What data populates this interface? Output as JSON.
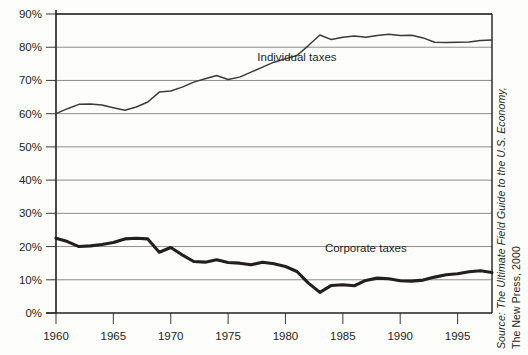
{
  "chart_data": {
    "type": "line",
    "title": "",
    "subtitle": "",
    "xlabel": "",
    "ylabel": "",
    "xlim": [
      1960,
      1998
    ],
    "ylim": [
      0,
      90
    ],
    "grid": true,
    "grid_axis": "y",
    "legend": "inline-annotations",
    "y_tick_labels": [
      "0%",
      "10%",
      "20%",
      "30%",
      "40%",
      "50%",
      "60%",
      "70%",
      "80%",
      "90%"
    ],
    "y_ticks": [
      0,
      10,
      20,
      30,
      40,
      50,
      60,
      70,
      80,
      90
    ],
    "x_tick_labels": [
      "1960",
      "1965",
      "1970",
      "1975",
      "1980",
      "1985",
      "1990",
      "1995"
    ],
    "x_ticks": [
      1960,
      1965,
      1970,
      1975,
      1980,
      1985,
      1990,
      1995
    ],
    "x": [
      1960,
      1961,
      1962,
      1963,
      1964,
      1965,
      1966,
      1967,
      1968,
      1969,
      1970,
      1971,
      1972,
      1973,
      1974,
      1975,
      1976,
      1977,
      1978,
      1979,
      1980,
      1981,
      1982,
      1983,
      1984,
      1985,
      1986,
      1987,
      1988,
      1989,
      1990,
      1991,
      1992,
      1993,
      1994,
      1995,
      1996,
      1997,
      1998
    ],
    "series": [
      {
        "name": "Individual taxes",
        "annotation": "Individual taxes",
        "values": [
          60.0,
          61.5,
          62.8,
          62.9,
          62.6,
          61.8,
          61.0,
          62.0,
          63.5,
          66.5,
          66.8,
          68.0,
          69.5,
          70.5,
          71.5,
          70.3,
          71.0,
          72.5,
          74.0,
          75.5,
          76.5,
          77.5,
          80.5,
          83.7,
          82.3,
          83.0,
          83.4,
          83.0,
          83.5,
          83.9,
          83.5,
          83.6,
          82.8,
          81.5,
          81.4,
          81.5,
          81.6,
          82.0,
          82.2
        ]
      },
      {
        "name": "Corporate taxes",
        "annotation": "Corporate taxes",
        "values": [
          22.5,
          21.5,
          20.0,
          20.2,
          20.6,
          21.2,
          22.3,
          22.5,
          22.3,
          18.3,
          19.7,
          17.5,
          15.5,
          15.3,
          16.0,
          15.2,
          15.0,
          14.5,
          15.3,
          14.8,
          14.0,
          12.5,
          9.0,
          6.2,
          8.3,
          8.5,
          8.2,
          9.8,
          10.5,
          10.3,
          9.7,
          9.6,
          9.9,
          10.8,
          11.5,
          11.8,
          12.4,
          12.7,
          12.2
        ]
      }
    ]
  },
  "source": {
    "line1": "Source: The Ultimate Field Guide to the U.S. Economy,",
    "line2": "The New Press, 2000"
  }
}
